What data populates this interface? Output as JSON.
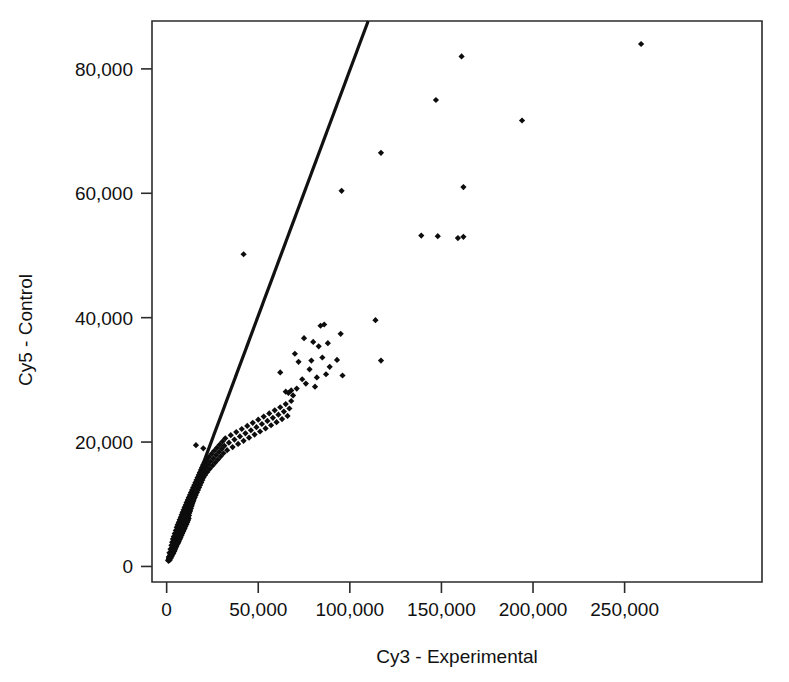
{
  "figure": {
    "kind": "scatter-plot",
    "background_color": "#ffffff",
    "foreground_color": "#111111",
    "width": 789,
    "height": 682
  },
  "chart_data": {
    "type": "scatter",
    "title": "",
    "subtitle": "",
    "xlabel": "Cy3 - Experimental",
    "ylabel": "Cy5 - Control",
    "xlim": [
      -8000,
      325000
    ],
    "ylim": [
      -2500,
      87700
    ],
    "grid": false,
    "legend": "none",
    "marker": {
      "shape": "diamond",
      "color": "#0d0d0d",
      "size_px": 5
    },
    "xticks": [
      0,
      50000,
      100000,
      150000,
      200000,
      250000
    ],
    "xticklabels": [
      "0",
      "50,000",
      "100,000",
      "150,000",
      "200,000",
      "250,000"
    ],
    "yticks": [
      0,
      20000,
      40000,
      60000,
      80000
    ],
    "yticklabels": [
      "0",
      "20,000",
      "40,000",
      "60,000",
      "80,000"
    ],
    "annotations": [
      {
        "name": "identity-reference-line",
        "type": "line",
        "description": "Straight reference line from origin through the plot",
        "x0": 0,
        "y0": 800,
        "x1": 110000,
        "y1": 87700,
        "color": "#111111",
        "width_px": 3.2
      }
    ],
    "series": [
      {
        "name": "spots",
        "label": "",
        "color": "#0d0d0d",
        "points": [
          [
            1200,
            1500
          ],
          [
            1500,
            2200
          ],
          [
            1800,
            1700
          ],
          [
            2100,
            2800
          ],
          [
            2400,
            2100
          ],
          [
            2600,
            3400
          ],
          [
            2800,
            2600
          ],
          [
            3000,
            3900
          ],
          [
            3200,
            3100
          ],
          [
            3400,
            4400
          ],
          [
            3500,
            2400
          ],
          [
            3700,
            3600
          ],
          [
            3900,
            4800
          ],
          [
            4000,
            3000
          ],
          [
            4200,
            4100
          ],
          [
            4400,
            5300
          ],
          [
            4600,
            3500
          ],
          [
            4800,
            4600
          ],
          [
            5000,
            5800
          ],
          [
            5100,
            3900
          ],
          [
            5300,
            5000
          ],
          [
            5500,
            6300
          ],
          [
            5700,
            4300
          ],
          [
            5900,
            5400
          ],
          [
            6000,
            6700
          ],
          [
            6200,
            4700
          ],
          [
            6400,
            5800
          ],
          [
            6600,
            7100
          ],
          [
            6800,
            5100
          ],
          [
            6900,
            6200
          ],
          [
            7100,
            7500
          ],
          [
            7300,
            5500
          ],
          [
            7500,
            6600
          ],
          [
            7700,
            7900
          ],
          [
            7800,
            5900
          ],
          [
            8000,
            7000
          ],
          [
            8200,
            8300
          ],
          [
            8400,
            6300
          ],
          [
            8600,
            7400
          ],
          [
            8700,
            8700
          ],
          [
            8900,
            6700
          ],
          [
            9100,
            7800
          ],
          [
            9300,
            9100
          ],
          [
            9500,
            7100
          ],
          [
            9600,
            8200
          ],
          [
            9800,
            9500
          ],
          [
            10000,
            7500
          ],
          [
            10200,
            8600
          ],
          [
            10400,
            9900
          ],
          [
            10500,
            7900
          ],
          [
            1000,
            900
          ],
          [
            1300,
            1200
          ],
          [
            1600,
            1000
          ],
          [
            1900,
            1400
          ],
          [
            2200,
            1300
          ],
          [
            2500,
            1800
          ],
          [
            2700,
            1600
          ],
          [
            2900,
            2000
          ],
          [
            3100,
            1900
          ],
          [
            3300,
            2300
          ],
          [
            3600,
            2100
          ],
          [
            3800,
            2500
          ],
          [
            4100,
            2400
          ],
          [
            4300,
            2900
          ],
          [
            4500,
            2700
          ],
          [
            4700,
            3200
          ],
          [
            4900,
            3000
          ],
          [
            5200,
            3400
          ],
          [
            5400,
            3300
          ],
          [
            5600,
            3700
          ],
          [
            5800,
            3600
          ],
          [
            6100,
            4000
          ],
          [
            6300,
            3800
          ],
          [
            6500,
            4300
          ],
          [
            6700,
            4100
          ],
          [
            7000,
            4500
          ],
          [
            7200,
            4400
          ],
          [
            7400,
            4900
          ],
          [
            7600,
            4700
          ],
          [
            7900,
            5100
          ],
          [
            8100,
            5000
          ],
          [
            8300,
            5400
          ],
          [
            8500,
            5300
          ],
          [
            8800,
            5700
          ],
          [
            9000,
            5600
          ],
          [
            9200,
            6000
          ],
          [
            9400,
            5900
          ],
          [
            9700,
            6400
          ],
          [
            9900,
            6200
          ],
          [
            10100,
            6600
          ],
          [
            10300,
            6500
          ],
          [
            10600,
            7000
          ],
          [
            10800,
            6800
          ],
          [
            11000,
            7200
          ],
          [
            11200,
            7100
          ],
          [
            11400,
            7600
          ],
          [
            11600,
            7400
          ],
          [
            11800,
            7800
          ],
          [
            12000,
            7700
          ],
          [
            12200,
            8200
          ],
          [
            10700,
            9000
          ],
          [
            10900,
            10300
          ],
          [
            11100,
            8300
          ],
          [
            11300,
            9400
          ],
          [
            11500,
            10700
          ],
          [
            11700,
            8700
          ],
          [
            11900,
            9800
          ],
          [
            12100,
            11100
          ],
          [
            12300,
            9100
          ],
          [
            12500,
            10200
          ],
          [
            12700,
            11500
          ],
          [
            12900,
            9500
          ],
          [
            13100,
            10600
          ],
          [
            13300,
            11900
          ],
          [
            13500,
            9900
          ],
          [
            13700,
            11000
          ],
          [
            13900,
            12300
          ],
          [
            14100,
            10300
          ],
          [
            14300,
            11400
          ],
          [
            14500,
            12700
          ],
          [
            14700,
            10700
          ],
          [
            14900,
            11800
          ],
          [
            15100,
            13100
          ],
          [
            15300,
            11100
          ],
          [
            15500,
            12200
          ],
          [
            15700,
            13500
          ],
          [
            15900,
            11500
          ],
          [
            16100,
            12600
          ],
          [
            16300,
            13900
          ],
          [
            16500,
            11900
          ],
          [
            12400,
            8600
          ],
          [
            12600,
            9000
          ],
          [
            12800,
            8900
          ],
          [
            13000,
            9400
          ],
          [
            13200,
            9300
          ],
          [
            13400,
            9800
          ],
          [
            13600,
            9700
          ],
          [
            13800,
            10200
          ],
          [
            14000,
            10100
          ],
          [
            14200,
            10600
          ],
          [
            14400,
            10500
          ],
          [
            14600,
            11000
          ],
          [
            14800,
            10900
          ],
          [
            15000,
            11400
          ],
          [
            15200,
            11300
          ],
          [
            15400,
            11800
          ],
          [
            15600,
            11700
          ],
          [
            15800,
            12200
          ],
          [
            16000,
            12100
          ],
          [
            16200,
            12600
          ],
          [
            16700,
            13000
          ],
          [
            16900,
            14300
          ],
          [
            17100,
            12300
          ],
          [
            17300,
            13400
          ],
          [
            17500,
            14700
          ],
          [
            17700,
            12700
          ],
          [
            17900,
            13800
          ],
          [
            18100,
            15100
          ],
          [
            18300,
            13100
          ],
          [
            18500,
            14200
          ],
          [
            18700,
            15500
          ],
          [
            18900,
            13500
          ],
          [
            19100,
            14600
          ],
          [
            19300,
            15900
          ],
          [
            19500,
            13900
          ],
          [
            19700,
            15000
          ],
          [
            19900,
            16300
          ],
          [
            20100,
            14300
          ],
          [
            20400,
            15400
          ],
          [
            20700,
            16700
          ],
          [
            21000,
            14700
          ],
          [
            21400,
            15900
          ],
          [
            21800,
            17100
          ],
          [
            22200,
            15200
          ],
          [
            22600,
            16400
          ],
          [
            23000,
            17600
          ],
          [
            23500,
            15700
          ],
          [
            24000,
            16900
          ],
          [
            24500,
            18100
          ],
          [
            25000,
            16200
          ],
          [
            25500,
            17400
          ],
          [
            26000,
            18600
          ],
          [
            26500,
            16700
          ],
          [
            27000,
            17900
          ],
          [
            27500,
            19100
          ],
          [
            28000,
            17200
          ],
          [
            28500,
            18400
          ],
          [
            29000,
            19600
          ],
          [
            29500,
            17700
          ],
          [
            30000,
            18900
          ],
          [
            16000,
            19500
          ],
          [
            30500,
            20100
          ],
          [
            31000,
            18200
          ],
          [
            31500,
            19400
          ],
          [
            32000,
            20600
          ],
          [
            33000,
            18700
          ],
          [
            34000,
            19900
          ],
          [
            35000,
            21100
          ],
          [
            36000,
            19200
          ],
          [
            37000,
            20400
          ],
          [
            38000,
            21600
          ],
          [
            39000,
            19700
          ],
          [
            40000,
            20900
          ],
          [
            41000,
            22100
          ],
          [
            42000,
            20200
          ],
          [
            43000,
            21400
          ],
          [
            44000,
            22600
          ],
          [
            45000,
            20700
          ],
          [
            46000,
            21900
          ],
          [
            47000,
            23100
          ],
          [
            48000,
            21200
          ],
          [
            49000,
            22400
          ],
          [
            50000,
            23600
          ],
          [
            51000,
            21700
          ],
          [
            52000,
            22900
          ],
          [
            53000,
            24100
          ],
          [
            54000,
            22200
          ],
          [
            55000,
            23400
          ],
          [
            56000,
            24600
          ],
          [
            57000,
            22700
          ],
          [
            58000,
            23900
          ],
          [
            59000,
            25100
          ],
          [
            60000,
            23200
          ],
          [
            61000,
            24400
          ],
          [
            62000,
            25600
          ],
          [
            63000,
            23700
          ],
          [
            64000,
            24900
          ],
          [
            65000,
            26100
          ],
          [
            66000,
            24200
          ],
          [
            67000,
            25400
          ],
          [
            68000,
            26600
          ],
          [
            42000,
            50200
          ],
          [
            20000,
            19000
          ],
          [
            62000,
            31200
          ],
          [
            65000,
            28100
          ],
          [
            66500,
            27900
          ],
          [
            68000,
            28300
          ],
          [
            69000,
            27500
          ],
          [
            70000,
            34200
          ],
          [
            71000,
            28600
          ],
          [
            72000,
            32900
          ],
          [
            74000,
            30100
          ],
          [
            75000,
            36700
          ],
          [
            76000,
            29400
          ],
          [
            78000,
            31700
          ],
          [
            79000,
            33100
          ],
          [
            80000,
            36100
          ],
          [
            81000,
            28900
          ],
          [
            82000,
            30400
          ],
          [
            83000,
            35400
          ],
          [
            84000,
            38700
          ],
          [
            85000,
            33600
          ],
          [
            86000,
            38900
          ],
          [
            87000,
            30900
          ],
          [
            88000,
            35900
          ],
          [
            89000,
            32100
          ],
          [
            93000,
            33200
          ],
          [
            95000,
            37400
          ],
          [
            96000,
            30700
          ],
          [
            114000,
            39600
          ],
          [
            117000,
            33100
          ],
          [
            95500,
            60400
          ],
          [
            117000,
            66500
          ],
          [
            139000,
            53200
          ],
          [
            148000,
            53100
          ],
          [
            147000,
            75000
          ],
          [
            159000,
            52800
          ],
          [
            162000,
            53000
          ],
          [
            161000,
            82000
          ],
          [
            162000,
            61000
          ],
          [
            194000,
            71700
          ],
          [
            259000,
            84000
          ]
        ]
      }
    ]
  }
}
